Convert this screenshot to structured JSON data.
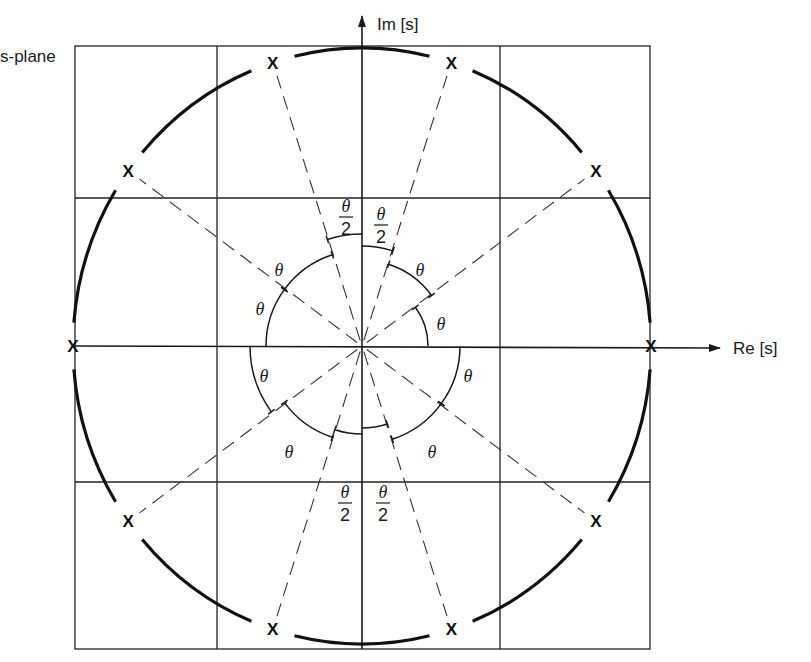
{
  "diagram": {
    "plane_label": "s-plane",
    "axes": {
      "real_label": "Re [s]",
      "imag_label": "Im [s]"
    },
    "pole_marker": "x",
    "pole_count": 10,
    "pole_angles_deg": [
      0,
      36,
      72,
      108,
      144,
      180,
      216,
      252,
      288,
      324
    ],
    "angle_label": "θ",
    "half_angle_label_num": "θ",
    "half_angle_label_den": "2",
    "colors": {
      "ink": "#1a1a1a",
      "background": "#ffffff"
    }
  }
}
